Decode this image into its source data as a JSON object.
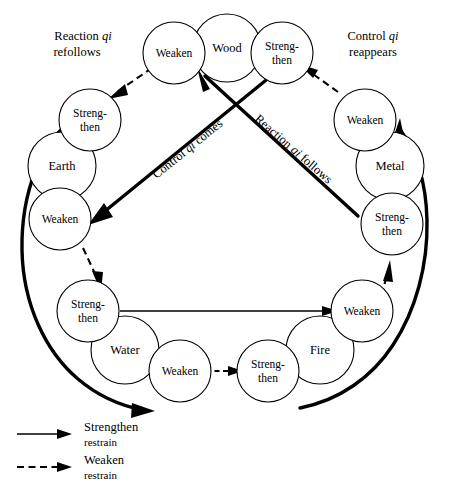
{
  "figure": {
    "background_color": "#ffffff",
    "line_color": "#000000"
  },
  "groups": [
    {
      "id": "wood",
      "element": "Wood",
      "weaken": "Weaken",
      "strengthen_line1": "Streng-",
      "strengthen_line2": "then"
    },
    {
      "id": "metal",
      "element": "Metal",
      "weaken": "Weaken",
      "strengthen_line1": "Streng-",
      "strengthen_line2": "then"
    },
    {
      "id": "fire",
      "element": "Fire",
      "weaken": "Weaken",
      "strengthen_line1": "Streng-",
      "strengthen_line2": "then"
    },
    {
      "id": "water",
      "element": "Water",
      "weaken": "Weaken",
      "strengthen_line1": "Streng-",
      "strengthen_line2": "then"
    },
    {
      "id": "earth",
      "element": "Earth",
      "weaken": "Weaken",
      "strengthen_line1": "Streng-",
      "strengthen_line2": "then"
    }
  ],
  "flow_labels": {
    "reaction_refollows": {
      "line1_a": "Reaction ",
      "line1_qi": "qi",
      "line2": "refollows"
    },
    "control_reappears": {
      "line1_a": "Control ",
      "line1_qi": "qi",
      "line2": "reappears"
    },
    "control_comes": {
      "before": "Control ",
      "qi": "qi",
      "after": " comes"
    },
    "reaction_follows": {
      "before": "Reaction ",
      "qi": "qi",
      "after": " follows"
    }
  },
  "legend": {
    "items": [
      {
        "style": "solid",
        "label_line1": "Strengthen",
        "label_line2": "restrain"
      },
      {
        "style": "dashed",
        "label_line1": "Weaken",
        "label_line2": "restrain"
      }
    ]
  }
}
